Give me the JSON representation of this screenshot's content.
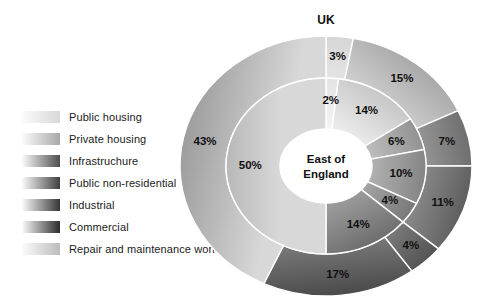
{
  "chart_data": {
    "type": "pie",
    "title": "UK",
    "subtitle": "East of England",
    "center_label_lines": [
      "East of",
      "England"
    ],
    "outer_ring_name": "UK",
    "inner_ring_name": "East of England",
    "categories": [
      "Public housing",
      "Private housing",
      "Infrastruchure",
      "Public non-residential",
      "Industrial",
      "Commercial",
      "Repair and maintenance work"
    ],
    "series": [
      {
        "name": "UK",
        "ring": "outer",
        "values": [
          3,
          15,
          7,
          11,
          4,
          17,
          43
        ],
        "labels": [
          "3%",
          "15%",
          "7%",
          "11%",
          "4%",
          "17%",
          "43%"
        ]
      },
      {
        "name": "East of England",
        "ring": "inner",
        "values": [
          2,
          14,
          6,
          10,
          4,
          14,
          50
        ],
        "labels": [
          "2%",
          "14%",
          "6%",
          "10%",
          "4%",
          "14%",
          "50%"
        ]
      }
    ],
    "start_angle": 0,
    "direction": "clockwise",
    "legend_position": "left",
    "grid": false,
    "colors": [
      "#e9e9e9",
      "#d2d2d2",
      "#9a9a9a",
      "#888888",
      "#767676",
      "#636363",
      "#b0b0b0"
    ]
  },
  "legend": {
    "items": [
      {
        "label": "Public housing"
      },
      {
        "label": "Private housing"
      },
      {
        "label": "Infrastruchure"
      },
      {
        "label": "Public non-residential"
      },
      {
        "label": "Industrial"
      },
      {
        "label": "Commercial"
      },
      {
        "label": "Repair and maintenance work"
      }
    ]
  }
}
